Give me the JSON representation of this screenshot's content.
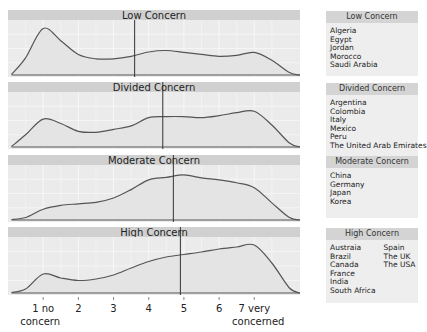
{
  "chart_data": {
    "type": "area",
    "title": "",
    "xlabel": "",
    "ylabel": "",
    "x_ticks": [
      1,
      2,
      3,
      4,
      5,
      6,
      7
    ],
    "x_tick_labels": [
      "1 no\nconcern",
      "2",
      "3",
      "4",
      "5",
      "6",
      "7 very\nconcerned"
    ],
    "xlim": [
      0.0,
      8.3
    ],
    "grid": true,
    "legend_position": "right",
    "panels": [
      {
        "name": "Low Concern",
        "mean": 3.6,
        "density_x": [
          0.1,
          0.5,
          1.0,
          1.5,
          2.0,
          2.5,
          3.0,
          3.5,
          4.0,
          4.5,
          5.0,
          5.5,
          6.0,
          6.5,
          7.0,
          7.5,
          8.0,
          8.3
        ],
        "density_y": [
          0.01,
          0.35,
          0.95,
          0.7,
          0.42,
          0.33,
          0.33,
          0.38,
          0.47,
          0.5,
          0.46,
          0.42,
          0.38,
          0.4,
          0.46,
          0.3,
          0.05,
          0.0
        ],
        "countries": [
          "Algeria",
          "Egypt",
          "Jordan",
          "Morocco",
          "Saudi Arabia"
        ]
      },
      {
        "name": "Divided Concern",
        "mean": 4.4,
        "density_x": [
          0.1,
          0.5,
          1.0,
          1.5,
          2.0,
          2.5,
          3.0,
          3.5,
          4.0,
          4.5,
          5.0,
          5.5,
          6.0,
          6.5,
          7.0,
          7.5,
          8.0,
          8.3
        ],
        "density_y": [
          0.01,
          0.25,
          0.57,
          0.48,
          0.32,
          0.3,
          0.36,
          0.43,
          0.6,
          0.62,
          0.62,
          0.6,
          0.64,
          0.7,
          0.73,
          0.45,
          0.08,
          0.0
        ],
        "countries": [
          "Argentina",
          "Colombia",
          "Italy",
          "Mexico",
          "Peru",
          "The United Arab Emirates"
        ]
      },
      {
        "name": "Moderate Concern",
        "mean": 4.7,
        "density_x": [
          0.1,
          0.5,
          1.0,
          1.5,
          2.0,
          2.5,
          3.0,
          3.5,
          4.0,
          4.5,
          5.0,
          5.5,
          6.0,
          6.5,
          7.0,
          7.5,
          8.0,
          8.3
        ],
        "density_y": [
          0.01,
          0.05,
          0.22,
          0.3,
          0.33,
          0.36,
          0.45,
          0.62,
          0.82,
          0.87,
          0.92,
          0.86,
          0.82,
          0.76,
          0.66,
          0.35,
          0.05,
          0.0
        ],
        "countries": [
          "China",
          "Germany",
          "Japan",
          "Korea"
        ]
      },
      {
        "name": "High Concern",
        "mean": 4.9,
        "density_x": [
          0.1,
          0.5,
          1.0,
          1.5,
          2.0,
          2.5,
          3.0,
          3.5,
          4.0,
          4.5,
          5.0,
          5.5,
          6.0,
          6.5,
          7.0,
          7.5,
          8.0,
          8.3
        ],
        "density_y": [
          0.01,
          0.08,
          0.38,
          0.3,
          0.25,
          0.28,
          0.36,
          0.5,
          0.63,
          0.72,
          0.77,
          0.82,
          0.88,
          0.92,
          0.96,
          0.6,
          0.1,
          0.0
        ],
        "countries": [
          "Austraia",
          "Brazil",
          "Canada",
          "France",
          "India",
          "South Africa",
          "Spain",
          "The UK",
          "The USA"
        ]
      }
    ]
  },
  "axis": {
    "ticks": [
      {
        "line1": "1 no",
        "line2": "concern"
      },
      {
        "line1": "2",
        "line2": ""
      },
      {
        "line1": "3",
        "line2": ""
      },
      {
        "line1": "4",
        "line2": ""
      },
      {
        "line1": "5",
        "line2": ""
      },
      {
        "line1": "6",
        "line2": ""
      },
      {
        "line1": "7 very",
        "line2": "concerned"
      }
    ]
  },
  "legend": [
    {
      "title": "Low Concern",
      "col1": [
        "Algeria",
        "Egypt",
        "Jordan",
        "Morocco",
        "Saudi Arabia"
      ],
      "col2": []
    },
    {
      "title": "Divided Concern",
      "col1": [
        "Argentina",
        "Colombia",
        "Italy",
        "Mexico",
        "Peru",
        "The United Arab Emirates"
      ],
      "col2": []
    },
    {
      "title": "Moderate Concern",
      "col1": [
        "China",
        "Germany",
        "Japan",
        "Korea"
      ],
      "col2": []
    },
    {
      "title": "High Concern",
      "col1": [
        "Austraia",
        "Brazil",
        "Canada",
        "France",
        "India",
        "South Africa"
      ],
      "col2": [
        "Spain",
        "The UK",
        "The USA"
      ]
    }
  ],
  "colors": {
    "strip": "#d0d0d0",
    "panel": "#ebebeb",
    "grid": "#f7f7f7",
    "line": "#555555",
    "mean_line": "#333333",
    "text": "#222222"
  }
}
